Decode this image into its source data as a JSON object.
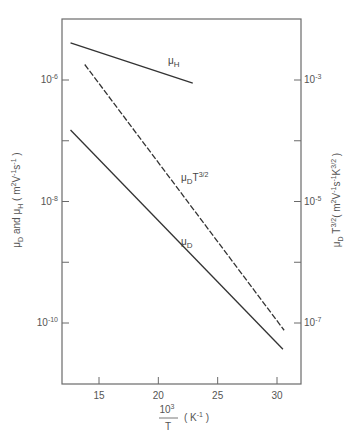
{
  "chart_data": {
    "type": "line",
    "title": "",
    "xlabel": "10^3 / T ( K^-1 )",
    "xlabel_parts": {
      "numerator": "10",
      "numerator_sup": "3",
      "denominator": "T",
      "unit": "( K",
      "unit_sup": "-1",
      "unit_close": ")"
    },
    "ylabel_left": "μD and μH ( m^2 V^-1 s^-1 )",
    "ylabel_right": "μD T^3/2 ( m^2 V^-1 s^-1 K^3/2 )",
    "xlim": [
      11.9,
      32.0
    ],
    "ylim_left": [
      5e-12,
      2e-05
    ],
    "ylim_right": [
      5e-08,
      0.02
    ],
    "yscale": "log",
    "grid": false,
    "x_ticks": [
      15,
      20,
      25,
      30
    ],
    "x_tick_labels": [
      "15",
      "20",
      "25",
      "30"
    ],
    "y_left_ticks": [
      {
        "base": "10",
        "exp": "-6",
        "value": 1e-06
      },
      {
        "base": "10",
        "exp": "-8",
        "value": 1e-08
      },
      {
        "base": "10",
        "exp": "-10",
        "value": 1e-10
      }
    ],
    "y_left_minor_ticks": [
      1e-07,
      1e-09
    ],
    "y_right_ticks": [
      {
        "base": "10",
        "exp": "-3",
        "value": 0.001
      },
      {
        "base": "10",
        "exp": "-5",
        "value": 1e-05
      },
      {
        "base": "10",
        "exp": "-7",
        "value": 1e-07
      }
    ],
    "y_right_minor_ticks": [
      0.0001,
      1e-06
    ],
    "series": [
      {
        "name": "μH",
        "label_main": "μ",
        "label_sub": "H",
        "label_sup": "",
        "axis": "left",
        "style": "solid",
        "x": [
          12.6,
          22.9
        ],
        "y": [
          4.1e-06,
          8.9e-07
        ]
      },
      {
        "name": "μD T^3/2",
        "label_main": "μ",
        "label_sub": "D",
        "label_sup": "T3/2",
        "axis": "right",
        "style": "dashed",
        "x": [
          13.8,
          30.6
        ],
        "y": [
          0.0018,
          7.6e-08
        ]
      },
      {
        "name": "μD",
        "label_main": "μ",
        "label_sub": "D",
        "label_sup": "",
        "axis": "left",
        "style": "solid",
        "x": [
          12.6,
          30.5
        ],
        "y": [
          1.5e-07,
          3.7e-11
        ]
      }
    ]
  }
}
